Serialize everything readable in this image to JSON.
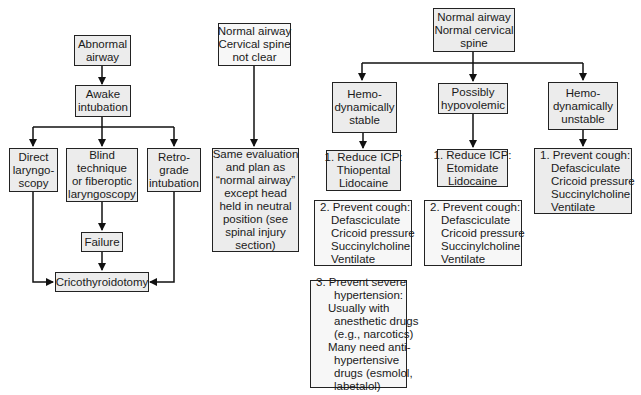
{
  "diagram": {
    "type": "flowchart",
    "colors": {
      "box_fill": "#ececec",
      "border": "#222222",
      "text": "#1a1a1a",
      "background": "#ffffff"
    },
    "abnormal_branch": {
      "root": {
        "lines": [
          "Abnormal",
          "airway"
        ]
      },
      "awake": {
        "lines": [
          "Awake",
          "intubation"
        ]
      },
      "direct": {
        "lines": [
          "Direct",
          "laryngo-",
          "scopy"
        ]
      },
      "blind": {
        "lines": [
          "Blind",
          "technique",
          "or fiberoptic",
          "laryngoscopy"
        ]
      },
      "retro": {
        "lines": [
          "Retro-",
          "grade",
          "intubation"
        ]
      },
      "failure": {
        "lines": [
          "Failure"
        ]
      },
      "crico": {
        "lines": [
          "Cricothyroidotomy"
        ]
      }
    },
    "cspine_branch": {
      "root": {
        "lines": [
          "Normal airway",
          "Cervical spine",
          "not clear"
        ]
      },
      "plan": {
        "lines": [
          "Same evaluation",
          "and plan as",
          "“normal airway”",
          "except head",
          "held in neutral",
          "position (see",
          "spinal injury",
          "section)"
        ]
      }
    },
    "normal_branch": {
      "root": {
        "lines": [
          "Normal airway",
          "Normal cervical",
          "spine"
        ]
      },
      "stable": {
        "header": {
          "lines": [
            "Hemo-",
            "dynamically",
            "stable"
          ]
        },
        "step1": {
          "lines": [
            "1. Reduce ICP:",
            "Thiopental",
            "Lidocaine"
          ]
        },
        "step2": {
          "lines": [
            "2. Prevent cough:",
            "Defasciculate",
            "Cricoid pressure",
            "Succinylcholine",
            "Ventilate"
          ]
        },
        "step3": {
          "lines": [
            "3. Prevent severe",
            "hypertension:",
            "Usually with",
            "anesthetic drugs",
            "(e.g., narcotics)",
            "Many need anti-",
            "hypertensive",
            "drugs (esmolol,",
            "labetalol)"
          ]
        }
      },
      "hypovolemic": {
        "header": {
          "lines": [
            "Possibly",
            "hypovolemic"
          ]
        },
        "step1": {
          "lines": [
            "1. Reduce ICP:",
            "Etomidate",
            "Lidocaine"
          ]
        },
        "step2": {
          "lines": [
            "2. Prevent cough:",
            "Defasciculate",
            "Cricoid pressure",
            "Succinylcholine",
            "Ventilate"
          ]
        }
      },
      "unstable": {
        "header": {
          "lines": [
            "Hemo-",
            "dynamically",
            "unstable"
          ]
        },
        "step1": {
          "lines": [
            "1. Prevent cough:",
            "Defasciculate",
            "Cricoid pressure",
            "Succinylcholine",
            "Ventilate"
          ]
        }
      }
    }
  }
}
